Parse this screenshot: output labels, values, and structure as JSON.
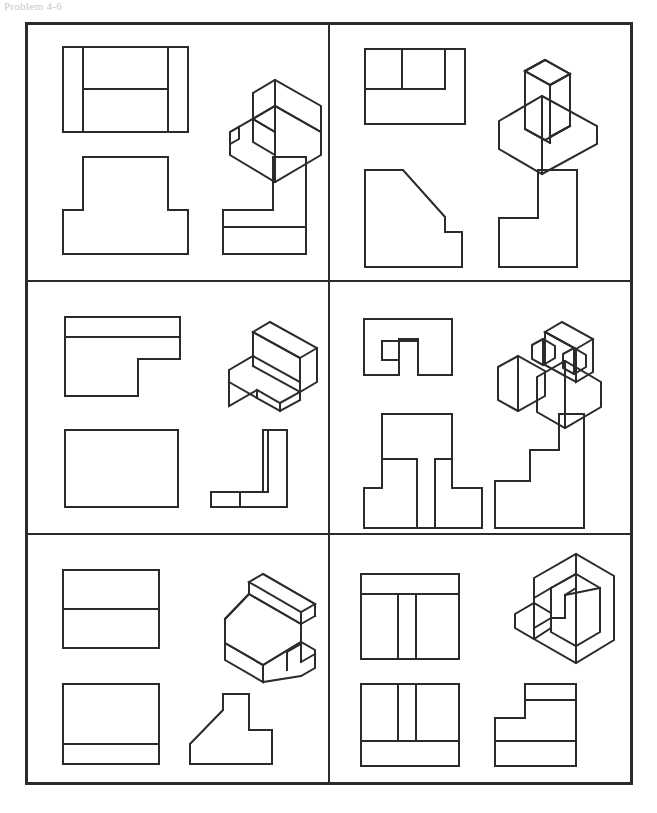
{
  "page": {
    "problem_label": "Problem 4-6",
    "width": 657,
    "height": 813,
    "background_color": "#ffffff",
    "ink_color": "#2b2b2b",
    "label_color": "#c9c9c9"
  },
  "sheet": {
    "border_color": "#2b2b2b",
    "border_width": 3,
    "divider_color": "#2b2b2b",
    "divider_width": 2,
    "columns": 2,
    "rows": 3,
    "x": 25,
    "y": 22,
    "width": 608,
    "height": 763
  },
  "legend": {
    "view_names": [
      "top-view",
      "isometric-view",
      "front-view",
      "right-side-view"
    ],
    "drawing_style": "orthographic-multiview-with-isometric-pictorial",
    "line_color": "#2b2b2b",
    "line_width": 2
  },
  "cells": [
    {
      "id": "cell-1",
      "position": "top-left",
      "row": 1,
      "column": 1,
      "shape_description": "stepped block with raised rear portion on a wide base",
      "views": {
        "top": "rectangle divided by two vertical lines near left and right edges and a horizontal line spanning the middle region",
        "front": "inverted T shape",
        "side": "L shape with a horizontal division line across the lower portion",
        "isometric": "two-level stepped solid, upper block set back and centered on a lower slab"
      }
    },
    {
      "id": "cell-2",
      "position": "top-right",
      "row": 1,
      "column": 2,
      "shape_description": "base slab with angled chamfered upright wall",
      "views": {
        "top": "rectangle with an inner notch outline at upper-left subdivided into two parts",
        "front": "rectangle with a large diagonal chamfer cut from the upper right, stepping down to a small ledge",
        "side": "L shape standing with tall right leg and a foot extending left",
        "isometric": "rectangular base slab supporting a tall block whose front face slopes down toward the viewer"
      }
    },
    {
      "id": "cell-3",
      "position": "middle-left",
      "row": 2,
      "column": 1,
      "shape_description": "flat L-shaped plate with a raised vertical back wall",
      "views": {
        "top": "L shaped outline with a horizontal line near the top representing the back wall thickness",
        "front": "plain rectangle",
        "side": "L shape lying down with a tall narrow right leg and a thin horizontal foot divided by a short vertical line",
        "isometric": "thin L-shaped horizontal plate with a tall thin vertical wall along the back edge"
      }
    },
    {
      "id": "cell-4",
      "position": "middle-right",
      "row": 2,
      "column": 2,
      "shape_description": "U-shaped base with two upright legs and small square posts",
      "views": {
        "top": "outer rectangle containing an inner bracket shape forming two legs with a connecting crossbar",
        "front": "two tall rectangular legs joined by an upper block, with a central slot between them",
        "side": "stair-step profile rising in three steps from left to right",
        "isometric": "two low blocks in front with small cubic posts and a tall upright wall behind"
      }
    },
    {
      "id": "cell-5",
      "position": "bottom-left",
      "row": 3,
      "column": 1,
      "shape_description": "wedge or ramp block with a raised rail on top and a base slab",
      "views": {
        "top": "rectangle divided by one horizontal line near the upper third",
        "front": "rectangle divided by one horizontal line near the bottom",
        "side": "profile with a vertical neck, long diagonal ramp down to the left and a stepped foot at the right",
        "isometric": "inclined ramp solid with a rectangular rail along the top edge, set on a base slab with a notch at the right"
      }
    },
    {
      "id": "cell-6",
      "position": "bottom-right",
      "row": 3,
      "column": 2,
      "shape_description": "channel block with a U-shaped cross section",
      "views": {
        "top": "rectangle with an inner T shaped division creating two pockets",
        "front": "rectangle with two tall slots leaving a central rib and a solid base band",
        "side": "L shape with a stepped inner notch and a horizontal band across the lower portion",
        "isometric": "U-shaped channel solid viewed from above showing the interior trough and a side step"
      }
    }
  ]
}
